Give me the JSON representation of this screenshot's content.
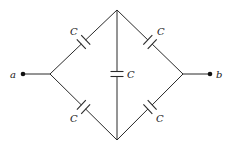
{
  "diagram": {
    "type": "capacitor-bridge-circuit",
    "terminals": [
      {
        "id": "a",
        "label": "a",
        "x": 23,
        "y": 74
      },
      {
        "id": "b",
        "label": "b",
        "x": 210,
        "y": 74
      }
    ],
    "vertices": {
      "left": {
        "x": 50,
        "y": 74
      },
      "top": {
        "x": 117,
        "y": 10
      },
      "right": {
        "x": 183,
        "y": 74
      },
      "bottom": {
        "x": 117,
        "y": 140
      }
    },
    "capacitors": [
      {
        "id": "c-upper-left",
        "label": "C",
        "between": [
          "left",
          "top"
        ]
      },
      {
        "id": "c-upper-right",
        "label": "C",
        "between": [
          "top",
          "right"
        ]
      },
      {
        "id": "c-middle",
        "label": "C",
        "between": [
          "top",
          "bottom"
        ]
      },
      {
        "id": "c-lower-left",
        "label": "C",
        "between": [
          "left",
          "bottom"
        ]
      },
      {
        "id": "c-lower-right",
        "label": "C",
        "between": [
          "bottom",
          "right"
        ]
      }
    ],
    "colors": {
      "line": "#2a2a2a",
      "background": "#ffffff"
    }
  }
}
